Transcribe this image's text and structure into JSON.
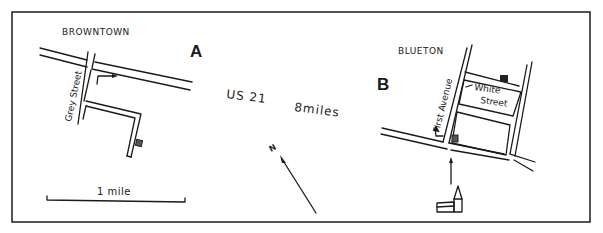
{
  "maps": {
    "a": {
      "letter": "A",
      "town": "BROWNTOWN",
      "street_label": "Grey Street",
      "scale_label": "1 mile"
    },
    "b": {
      "letter": "B",
      "town": "BLUETON",
      "avenue_label": "First Avenue",
      "street_label_1": "White",
      "street_label_2": "Street"
    }
  },
  "connector": {
    "road_label": "US 21",
    "distance_label": "8miles",
    "north_label": "N"
  },
  "colors": {
    "ink": "#1a1a1a",
    "background": "#ffffff"
  }
}
